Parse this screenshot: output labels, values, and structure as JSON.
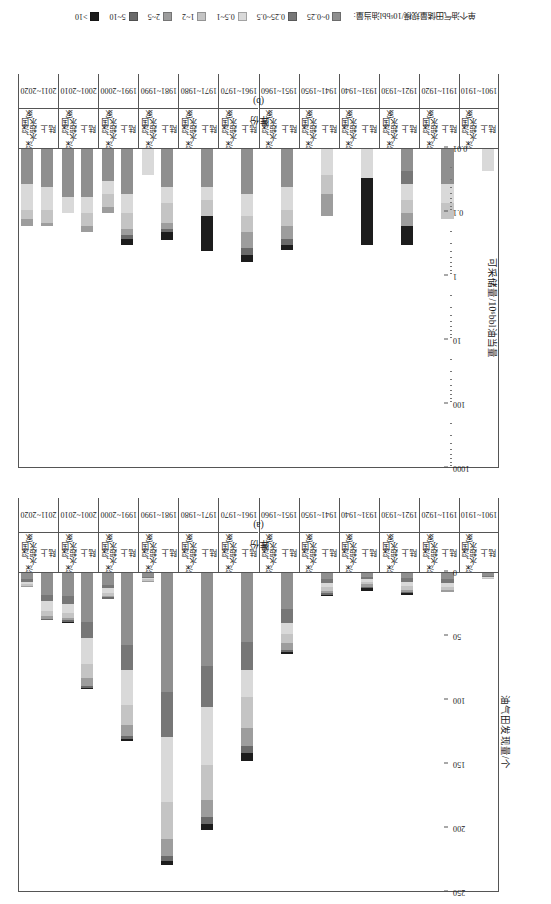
{
  "figure": {
    "legend_title": "单个油气田储量规模/10⁶bbl油当量:",
    "legend": [
      {
        "label": "0~0.25",
        "color": "#8f8f8f"
      },
      {
        "label": "0.25~0.5",
        "color": "#777777"
      },
      {
        "label": "0.5~1",
        "color": "#d9d9d9"
      },
      {
        "label": "1~2",
        "color": "#c4c4c4"
      },
      {
        "label": "2~5",
        "color": "#9d9d9d"
      },
      {
        "label": "5~10",
        "color": "#6a6a6a"
      },
      {
        "label": ">10",
        "color": "#1c1c1c"
      }
    ]
  },
  "panel_a": {
    "caption": "(a)",
    "xlabel": "年份",
    "ylabel": "油气田发现量/个",
    "yticks": [
      "0",
      "50",
      "100",
      "150",
      "200",
      "250"
    ]
  },
  "panel_b": {
    "caption": "(b)",
    "xlabel": "年份",
    "ylabel": "可采储量/10⁶bbl油当量",
    "yticks": [
      "0.01",
      "0.1",
      "1",
      "10",
      "100",
      "1000"
    ]
  },
  "groups": {
    "onshore": "陆上",
    "deepwater": "深水、超深水国家"
  },
  "chart_data": [
    {
      "type": "bar",
      "id": "panel_a",
      "title": "(a) 油气田发现量",
      "xlabel": "年份",
      "ylabel": "油气田发现量/个",
      "ylim": [
        0,
        250
      ],
      "yticks": [
        0,
        50,
        100,
        150,
        200,
        250
      ],
      "grid": false,
      "legend_position": "bottom",
      "stacked": true,
      "size_classes": [
        "0~0.25",
        "0.25~0.5",
        "0.5~1",
        "1~2",
        "2~5",
        "5~10",
        ">10"
      ],
      "categories": [
        "1901~1910",
        "1911~1920",
        "1921~1930",
        "1931~1940",
        "1941~1950",
        "1951~1960",
        "1961~1970",
        "1971~1980",
        "1981~1990",
        "1991~2000",
        "2001~2010",
        "2011~2020"
      ],
      "subgroups": [
        "陆上",
        "深水、超深水国家"
      ],
      "series": [
        {
          "subgroup": "陆上",
          "stacks": [
            {
              "category": "1901~1910",
              "values": [
                2,
                1,
                1,
                1,
                0,
                0,
                0
              ]
            },
            {
              "category": "1911~1920",
              "values": [
                5,
                3,
                3,
                2,
                2,
                0,
                0
              ]
            },
            {
              "category": "1921~1930",
              "values": [
                4,
                3,
                3,
                3,
                2,
                1,
                1
              ]
            },
            {
              "category": "1931~1940",
              "values": [
                3,
                2,
                2,
                2,
                2,
                1,
                2
              ]
            },
            {
              "category": "1941~1950",
              "values": [
                5,
                3,
                3,
                3,
                2,
                1,
                1
              ]
            },
            {
              "category": "1951~1960",
              "values": [
                28,
                11,
                9,
                7,
                5,
                2,
                1
              ]
            },
            {
              "category": "1961~1970",
              "values": [
                54,
                22,
                21,
                24,
                14,
                6,
                6
              ]
            },
            {
              "category": "1971~1980",
              "values": [
                73,
                32,
                45,
                27,
                14,
                5,
                5
              ]
            },
            {
              "category": "1981~1990",
              "values": [
                93,
                35,
                51,
                29,
                13,
                4,
                3
              ]
            },
            {
              "category": "1991~2000",
              "values": [
                56,
                20,
                27,
                16,
                8,
                3,
                1
              ]
            },
            {
              "category": "2001~2010",
              "values": [
                38,
                13,
                20,
                11,
                6,
                2,
                1
              ]
            },
            {
              "category": "2011~2020",
              "values": [
                17,
                5,
                8,
                4,
                2,
                1,
                0
              ]
            }
          ]
        },
        {
          "subgroup": "深水、超深水国家",
          "stacks": [
            {
              "category": "1901~1910",
              "values": [
                0,
                0,
                0,
                0,
                0,
                0,
                0
              ]
            },
            {
              "category": "1911~1920",
              "values": [
                0,
                0,
                0,
                0,
                0,
                0,
                0
              ]
            },
            {
              "category": "1921~1930",
              "values": [
                0,
                0,
                0,
                0,
                0,
                0,
                0
              ]
            },
            {
              "category": "1931~1940",
              "values": [
                0,
                0,
                0,
                0,
                0,
                0,
                0
              ]
            },
            {
              "category": "1941~1950",
              "values": [
                0,
                0,
                0,
                0,
                0,
                0,
                0
              ]
            },
            {
              "category": "1951~1960",
              "values": [
                0,
                0,
                0,
                0,
                0,
                0,
                0
              ]
            },
            {
              "category": "1961~1970",
              "values": [
                0,
                0,
                0,
                0,
                0,
                0,
                0
              ]
            },
            {
              "category": "1971~1980",
              "values": [
                0,
                0,
                0,
                0,
                0,
                0,
                0
              ]
            },
            {
              "category": "1981~1990",
              "values": [
                3,
                1,
                1,
                1,
                1,
                0,
                0
              ]
            },
            {
              "category": "1991~2000",
              "values": [
                9,
                3,
                4,
                2,
                1,
                1,
                0
              ]
            },
            {
              "category": "2001~2010",
              "values": [
                18,
                6,
                7,
                4,
                2,
                1,
                1
              ]
            },
            {
              "category": "2011~2020",
              "values": [
                5,
                2,
                2,
                1,
                1,
                0,
                0
              ]
            }
          ]
        }
      ]
    },
    {
      "type": "bar",
      "id": "panel_b",
      "title": "(b) 可采储量",
      "xlabel": "年份",
      "ylabel": "可采储量/10⁶bbl油当量",
      "yscale": "log",
      "ylim": [
        0.01,
        1000
      ],
      "yticks": [
        0.01,
        0.1,
        1,
        10,
        100,
        1000
      ],
      "grid": false,
      "legend_position": "bottom",
      "stacked": true,
      "size_classes": [
        "0~0.25",
        "0.25~0.5",
        "0.5~1",
        "1~2",
        "2~5",
        "5~10",
        ">10"
      ],
      "categories": [
        "1901~1910",
        "1911~1920",
        "1921~1930",
        "1931~1940",
        "1941~1950",
        "1951~1960",
        "1961~1970",
        "1971~1980",
        "1981~1990",
        "1991~2000",
        "2001~2010",
        "2011~2020"
      ],
      "subgroups": [
        "陆上",
        "深水、超深水国家"
      ],
      "series": [
        {
          "subgroup": "陆上",
          "stacks": [
            {
              "category": "1901~1910",
              "values": [
                0,
                0,
                0.35,
                0,
                0,
                0,
                0
              ]
            },
            {
              "category": "1911~1920",
              "values": [
                0.55,
                0,
                0.3,
                0.25,
                0,
                0,
                0
              ]
            },
            {
              "category": "1921~1930",
              "values": [
                0.35,
                0.2,
                0.25,
                0.2,
                0.2,
                0,
                0.3
              ]
            },
            {
              "category": "1931~1940",
              "values": [
                0,
                0,
                0.45,
                0,
                0,
                0,
                1.05
              ]
            },
            {
              "category": "1941~1950",
              "values": [
                0,
                0,
                0.4,
                0.3,
                0.35,
                0,
                0
              ]
            },
            {
              "category": "1951~1960",
              "values": [
                0.6,
                0,
                0.35,
                0.25,
                0.2,
                0.1,
                0.08
              ]
            },
            {
              "category": "1961~1970",
              "values": [
                0.7,
                0,
                0.35,
                0.25,
                0.25,
                0.1,
                0.12
              ]
            },
            {
              "category": "1971~1980",
              "values": [
                0.6,
                0,
                0.2,
                0.25,
                0,
                0,
                0.55
              ]
            },
            {
              "category": "1981~1990",
              "values": [
                0.6,
                0,
                0.25,
                0.3,
                0.1,
                0.05,
                0.12
              ]
            },
            {
              "category": "1991~2000",
              "values": [
                0.7,
                0,
                0.3,
                0.25,
                0.1,
                0.05,
                0.1
              ]
            },
            {
              "category": "2001~2010",
              "values": [
                0.75,
                0,
                0.25,
                0.2,
                0.1,
                0,
                0
              ]
            },
            {
              "category": "2011~2020",
              "values": [
                0.6,
                0,
                0.35,
                0.2,
                0.05,
                0,
                0
              ]
            }
          ]
        },
        {
          "subgroup": "深水、超深水国家",
          "stacks": [
            {
              "category": "1901~1910",
              "values": [
                0,
                0,
                0,
                0,
                0,
                0,
                0
              ]
            },
            {
              "category": "1911~1920",
              "values": [
                0,
                0,
                0,
                0,
                0,
                0,
                0
              ]
            },
            {
              "category": "1921~1930",
              "values": [
                0,
                0,
                0,
                0,
                0,
                0,
                0
              ]
            },
            {
              "category": "1931~1940",
              "values": [
                0,
                0,
                0,
                0,
                0,
                0,
                0
              ]
            },
            {
              "category": "1941~1950",
              "values": [
                0,
                0,
                0,
                0,
                0,
                0,
                0
              ]
            },
            {
              "category": "1951~1960",
              "values": [
                0,
                0,
                0,
                0,
                0,
                0,
                0
              ]
            },
            {
              "category": "1961~1970",
              "values": [
                0,
                0,
                0,
                0,
                0,
                0,
                0
              ]
            },
            {
              "category": "1971~1980",
              "values": [
                0,
                0,
                0,
                0,
                0,
                0,
                0
              ]
            },
            {
              "category": "1981~1990",
              "values": [
                0,
                0,
                0.4,
                0,
                0,
                0,
                0
              ]
            },
            {
              "category": "1991~2000",
              "values": [
                0.5,
                0,
                0.2,
                0.2,
                0.1,
                0,
                0
              ]
            },
            {
              "category": "2001~2010",
              "values": [
                0.75,
                0,
                0.25,
                0,
                0,
                0,
                0
              ]
            },
            {
              "category": "2011~2020",
              "values": [
                0.55,
                0,
                0.4,
                0.15,
                0.1,
                0,
                0
              ]
            }
          ]
        }
      ]
    }
  ]
}
